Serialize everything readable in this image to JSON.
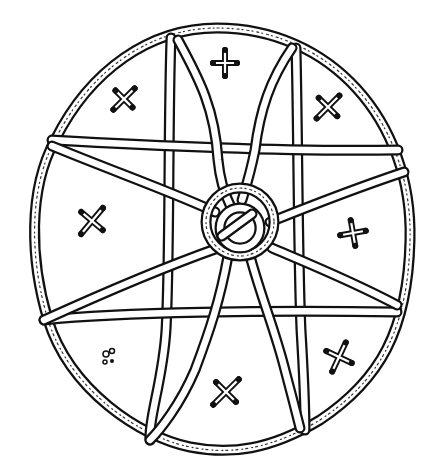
{
  "illustration": {
    "subject": "hand-drawn circular star diagram",
    "ink_color": "#111111",
    "paper_color": "#ffffff",
    "outer_ring": {
      "cx": 217,
      "cy": 238,
      "rx": 196,
      "ry": 210
    },
    "center_knot": {
      "cx": 240,
      "cy": 222,
      "r_outer": 34,
      "r_inner": 22
    },
    "crosses": [
      {
        "name": "top-center",
        "x": 225,
        "y": 63,
        "angle": 0
      },
      {
        "name": "upper-left",
        "x": 124,
        "y": 99,
        "angle": 45
      },
      {
        "name": "upper-right",
        "x": 327,
        "y": 107,
        "angle": 45
      },
      {
        "name": "mid-left",
        "x": 92,
        "y": 221,
        "angle": 45
      },
      {
        "name": "mid-right",
        "x": 353,
        "y": 233,
        "angle": 0
      },
      {
        "name": "lower-right",
        "x": 339,
        "y": 357,
        "angle": 45
      },
      {
        "name": "lower-center",
        "x": 226,
        "y": 392,
        "angle": 45
      }
    ],
    "small_mark": {
      "x": 108,
      "y": 357
    }
  }
}
